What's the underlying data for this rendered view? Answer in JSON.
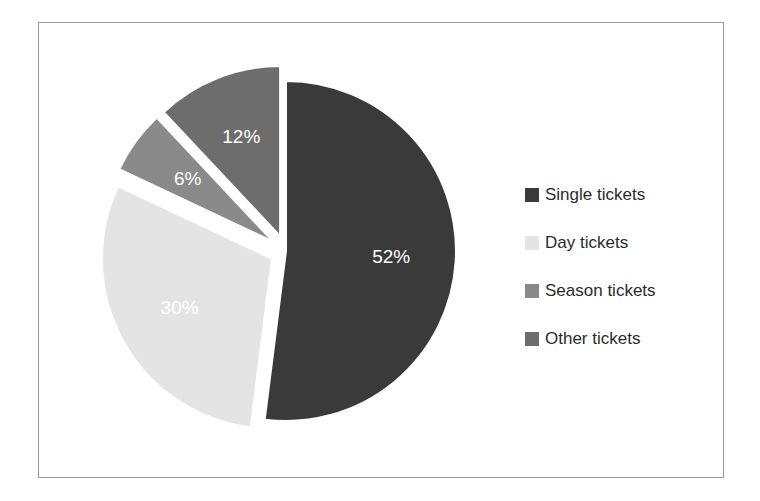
{
  "chart_data": {
    "type": "pie",
    "title": "",
    "categories": [
      "Single tickets",
      "Day tickets",
      "Season tickets",
      "Other tickets"
    ],
    "values": [
      52,
      30,
      6,
      12
    ],
    "value_labels": [
      "52%",
      "30%",
      "6%",
      "12%"
    ],
    "unit": "%",
    "colors": [
      "#3a3a3a",
      "#e4e4e4",
      "#8a8a8a",
      "#6d6d6d"
    ],
    "exploded": [
      false,
      true,
      true,
      true
    ],
    "label_color": "#ffffff",
    "legend_position": "right",
    "grid": false,
    "slices": [
      {
        "label": "Single tickets",
        "value": 52,
        "value_label": "52%",
        "color": "#3a3a3a"
      },
      {
        "label": "Day tickets",
        "value": 30,
        "value_label": "30%",
        "color": "#e4e4e4"
      },
      {
        "label": "Season tickets",
        "value": 6,
        "value_label": "6%",
        "color": "#8a8a8a"
      },
      {
        "label": "Other tickets",
        "value": 12,
        "value_label": "12%",
        "color": "#6d6d6d"
      }
    ]
  },
  "legend": {
    "items": [
      {
        "label": "Single tickets",
        "color": "#3a3a3a"
      },
      {
        "label": "Day tickets",
        "color": "#e4e4e4"
      },
      {
        "label": "Season tickets",
        "color": "#8a8a8a"
      },
      {
        "label": "Other tickets",
        "color": "#6d6d6d"
      }
    ]
  },
  "frame": {
    "border_color": "#9a9a9a",
    "background": "#ffffff"
  }
}
